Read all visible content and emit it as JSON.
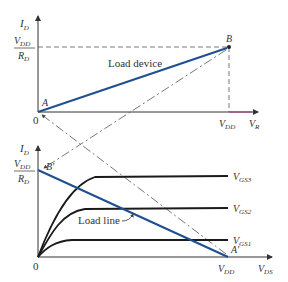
{
  "colors": {
    "axis": "#333333",
    "load_line": "#1f4f8f",
    "curve": "#1a1a1a",
    "dashed": "#555555",
    "background": "#ffffff"
  },
  "top_graph": {
    "y_axis_label": "I",
    "y_axis_sub": "D",
    "y_tick_num": "V",
    "y_tick_num_sub": "DD",
    "y_tick_den": "R",
    "y_tick_den_sub": "D",
    "origin": "0",
    "x_tick": "V",
    "x_tick_sub": "DD",
    "x_axis_label": "V",
    "x_axis_sub": "R",
    "point_a": "A",
    "point_b": "B",
    "line_label": "Load device"
  },
  "bottom_graph": {
    "y_axis_label": "I",
    "y_axis_sub": "D",
    "y_tick_num": "V",
    "y_tick_num_sub": "DD",
    "y_tick_den": "R",
    "y_tick_den_sub": "D",
    "origin": "0",
    "x_tick": "V",
    "x_tick_sub": "DD",
    "x_axis_label": "V",
    "x_axis_sub": "DS",
    "point_a_prime": "A′",
    "point_b_prime": "B′",
    "load_line_label": "Load line",
    "curves": [
      {
        "name": "V",
        "sub": "GS3"
      },
      {
        "name": "V",
        "sub": "GS2"
      },
      {
        "name": "V",
        "sub": "GS1"
      }
    ]
  }
}
